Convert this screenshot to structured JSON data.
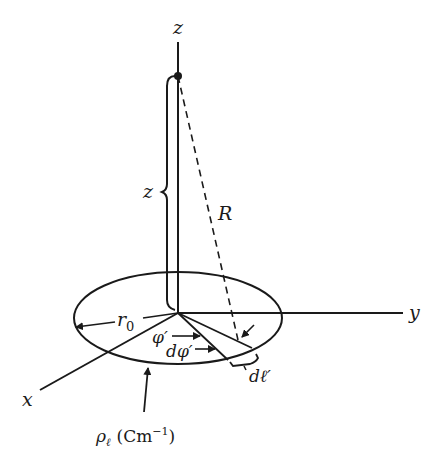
{
  "diagram": {
    "type": "ring-of-line-charge geometry",
    "axes": {
      "z": "z",
      "y": "y",
      "x": "x"
    },
    "labels": {
      "height": "z",
      "distance": "R",
      "radius": "r",
      "radius_sub": "0",
      "angle": "φ′",
      "angle_increment": "dφ′",
      "length_element": "dℓ′",
      "charge_density_symbol": "ρ",
      "charge_density_sub": "ℓ",
      "charge_density_units": "(Cm",
      "charge_density_exp": "−1",
      "charge_density_close": ")"
    },
    "colors": {
      "stroke": "#1a1a1a",
      "background": "#ffffff"
    }
  }
}
